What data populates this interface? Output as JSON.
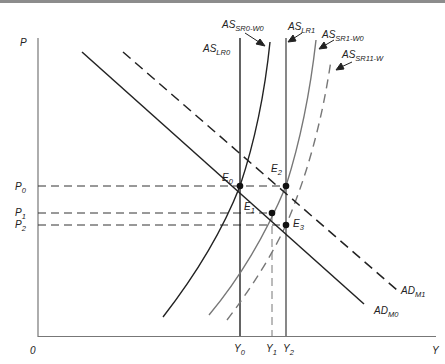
{
  "diagram": {
    "axes": {
      "y_label": "P",
      "x_label": "Y",
      "origin_label": "0"
    },
    "price_levels": [
      {
        "id": "P0",
        "base": "P",
        "sub": "0"
      },
      {
        "id": "P1",
        "base": "P",
        "sub": "1"
      },
      {
        "id": "P2",
        "base": "P",
        "sub": "2"
      }
    ],
    "output_levels": [
      {
        "id": "Y0",
        "base": "Y",
        "sub": "0"
      },
      {
        "id": "Y1",
        "base": "Y",
        "sub": "1"
      },
      {
        "id": "Y2",
        "base": "Y",
        "sub": "2"
      }
    ],
    "curves": [
      {
        "id": "AS_LR0",
        "base": "AS",
        "sub": "LR0",
        "style": "solid",
        "color": "#222222"
      },
      {
        "id": "AS_SR0_W0",
        "base": "AS",
        "sub": "SR0-W0",
        "style": "solid",
        "color": "#222222"
      },
      {
        "id": "AS_LR1",
        "base": "AS",
        "sub": "LR1",
        "style": "solid",
        "color": "#555555"
      },
      {
        "id": "AS_SR1_W0",
        "base": "AS",
        "sub": "SR1-W0",
        "style": "solid",
        "color": "#777777"
      },
      {
        "id": "AS_SR11_W",
        "base": "AS",
        "sub": "SR11-W",
        "style": "dashed",
        "color": "#777777"
      },
      {
        "id": "AD_M0",
        "base": "AD",
        "sub": "M0",
        "style": "solid",
        "color": "#222222"
      },
      {
        "id": "AD_M1",
        "base": "AD",
        "sub": "M1",
        "style": "dashed",
        "color": "#222222"
      }
    ],
    "equilibria": [
      {
        "id": "E0",
        "base": "E",
        "sub": "0"
      },
      {
        "id": "E1",
        "base": "E",
        "sub": "1"
      },
      {
        "id": "E2",
        "base": "E",
        "sub": "2"
      },
      {
        "id": "E3",
        "base": "E",
        "sub": "3"
      }
    ]
  }
}
